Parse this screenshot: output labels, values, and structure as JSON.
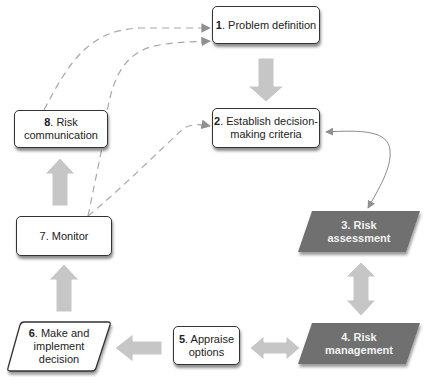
{
  "diagram": {
    "type": "risk-management-cycle",
    "colors": {
      "box_border": "#333333",
      "box_fill": "#ffffff",
      "parallelogram_dark": "#6f6f6f",
      "block_arrow": "#c4c4c4",
      "dashed_line": "#a0a0a0",
      "connector": "#8a8a8a"
    },
    "nodes": [
      {
        "id": "1",
        "num": "1",
        "text": ". Problem definition",
        "shape": "rounded-rect"
      },
      {
        "id": "2",
        "num": "2",
        "text_line1": ". Establish decision-",
        "text_line2": "making criteria",
        "shape": "rounded-rect"
      },
      {
        "id": "3",
        "text_line1": "3. Risk",
        "text_line2": "assessment",
        "shape": "parallelogram-dark"
      },
      {
        "id": "4",
        "text_line1": "4. Risk",
        "text_line2": "management",
        "shape": "parallelogram-dark"
      },
      {
        "id": "5",
        "num": "5",
        "text_line1": ". Appraise",
        "text_line2": "options",
        "shape": "rounded-rect"
      },
      {
        "id": "6",
        "num": "6",
        "text_line1": ". Make and",
        "text_line2": "implement",
        "text_line3": "decision",
        "shape": "parallelogram-white"
      },
      {
        "id": "7",
        "text": "7. Monitor",
        "shape": "rounded-rect"
      },
      {
        "id": "8",
        "num": "8",
        "text_line1": ". Risk",
        "text_line2": "communication",
        "shape": "rounded-rect"
      }
    ],
    "edges": [
      {
        "from": "1",
        "to": "2",
        "style": "block-arrow-down"
      },
      {
        "from": "2",
        "to": "3",
        "style": "curved-double-arrow"
      },
      {
        "from": "3",
        "to": "4",
        "style": "block-double-arrow-vertical"
      },
      {
        "from": "4",
        "to": "5",
        "style": "block-double-arrow-horizontal"
      },
      {
        "from": "5",
        "to": "6",
        "style": "block-arrow-left"
      },
      {
        "from": "6",
        "to": "7",
        "style": "block-arrow-up"
      },
      {
        "from": "7",
        "to": "8",
        "style": "block-arrow-up"
      },
      {
        "from": "8",
        "to": "1",
        "style": "dashed-curve"
      },
      {
        "from": "7",
        "to": "1",
        "style": "dashed-curve"
      },
      {
        "from": "7",
        "to": "2",
        "style": "dashed-curve"
      }
    ]
  }
}
